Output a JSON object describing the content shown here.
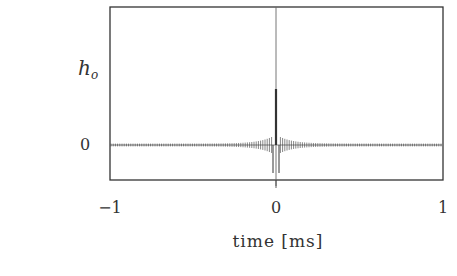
{
  "chart_data": {
    "type": "line",
    "title": "",
    "xlabel": "time [ms]",
    "ylabel": "h_o",
    "ylabel_main": "h",
    "ylabel_sub": "o",
    "xlim": [
      -1,
      1
    ],
    "x_ticks": [
      "-1",
      "0",
      "1"
    ],
    "y_ticks": [
      "0"
    ],
    "grid": false,
    "legend": null,
    "series": [
      {
        "name": "h_o",
        "x": [
          -0.06,
          -0.04,
          -0.02,
          -0.01,
          0.0,
          0.01,
          0.02,
          0.04,
          0.06
        ],
        "values": [
          0.12,
          0.2,
          0.3,
          -0.5,
          1.0,
          -0.5,
          0.3,
          0.2,
          0.12
        ]
      }
    ],
    "colors": {
      "axis": "#333333",
      "trace": "#333333",
      "zero_line": "#777777"
    }
  },
  "labels": {
    "ylabel_main": "h",
    "ylabel_sub": "o",
    "ytick_zero": "0",
    "xtick_left": "−1",
    "xtick_mid": "0",
    "xtick_right": "1",
    "xlabel": "time [ms]"
  }
}
